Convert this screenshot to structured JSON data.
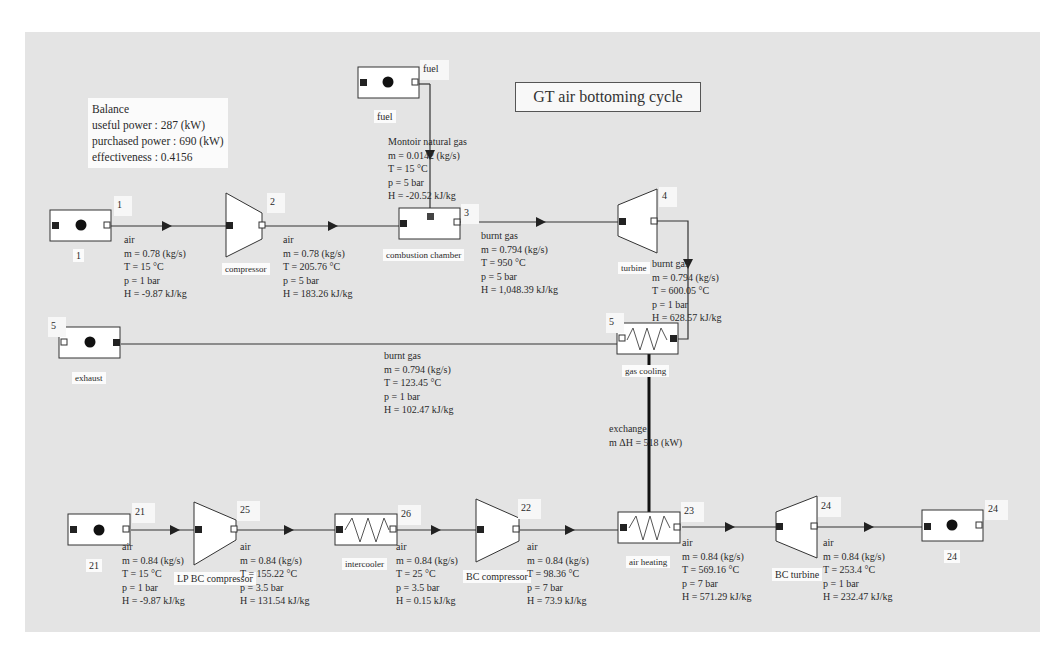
{
  "title": "GT air bottoming cycle",
  "balance": {
    "heading": "Balance",
    "useful_power": "useful power : 287 (kW)",
    "purchased_power": "purchased power : 690 (kW)",
    "effectiveness": "effectiveness : 0.4156"
  },
  "components": {
    "source_1": {
      "number": "1",
      "name": "1"
    },
    "fuel": {
      "number": "fuel",
      "name": "fuel"
    },
    "compressor": {
      "number": "2",
      "name": "compressor"
    },
    "combustion_chamber": {
      "number": "3",
      "name": "combustion chamber"
    },
    "turbine": {
      "number": "4",
      "name": "turbine"
    },
    "gas_cooling": {
      "number": "5",
      "name": "gas cooling"
    },
    "exhaust": {
      "number": "5",
      "name": "exhaust"
    },
    "source_21": {
      "number": "21",
      "name": "21"
    },
    "lp_bc_compressor": {
      "number": "25",
      "name": "LP BC compressor"
    },
    "intercooler": {
      "number": "26",
      "name": "intercooler"
    },
    "bc_compressor": {
      "number": "22",
      "name": "BC compressor"
    },
    "air_heating": {
      "number": "23",
      "name": "air heating"
    },
    "bc_turbine": {
      "number": "24",
      "name": "BC turbine"
    },
    "sink_24": {
      "number": "24",
      "name": "24"
    }
  },
  "streams": {
    "s1": {
      "fluid": "air",
      "m": "m = 0.78 (kg/s)",
      "T": "T = 15 °C",
      "p": "p = 1 bar",
      "H": "H = -9.87 kJ/kg"
    },
    "s2": {
      "fluid": "air",
      "m": "m = 0.78 (kg/s)",
      "T": "T = 205.76 °C",
      "p": "p = 5 bar",
      "H": "H = 183.26 kJ/kg"
    },
    "fuel": {
      "fluid": "Montoir natural gas",
      "m": "m = 0.0142 (kg/s)",
      "T": "T = 15 °C",
      "p": "p = 5 bar",
      "H": "H = -20.52 kJ/kg"
    },
    "s3": {
      "fluid": "burnt gas",
      "m": "m = 0.794 (kg/s)",
      "T": "T = 950 °C",
      "p": "p = 5 bar",
      "H": "H = 1,048.39 kJ/kg"
    },
    "s4": {
      "fluid": "burnt gas",
      "m": "m = 0.794 (kg/s)",
      "T": "T = 600.05 °C",
      "p": "p = 1 bar",
      "H": "H = 628.57 kJ/kg"
    },
    "s5": {
      "fluid": "burnt gas",
      "m": "m = 0.794 (kg/s)",
      "T": "T = 123.45 °C",
      "p": "p = 1 bar",
      "H": "H = 102.47 kJ/kg"
    },
    "s21": {
      "fluid": "air",
      "m": "m = 0.84 (kg/s)",
      "T": "T = 15 °C",
      "p": "p = 1 bar",
      "H": "H = -9.87 kJ/kg"
    },
    "s25": {
      "fluid": "air",
      "m": "m = 0.84 (kg/s)",
      "T": "T = 155.22 °C",
      "p": "p = 3.5 bar",
      "H": "H = 131.54 kJ/kg"
    },
    "s26": {
      "fluid": "air",
      "m": "m = 0.84 (kg/s)",
      "T": "T = 25 °C",
      "p": "p = 3.5 bar",
      "H": "H = 0.15 kJ/kg"
    },
    "s22": {
      "fluid": "air",
      "m": "m = 0.84 (kg/s)",
      "T": "T = 98.36 °C",
      "p": "p = 7 bar",
      "H": "H = 73.9 kJ/kg"
    },
    "s23": {
      "fluid": "air",
      "m": "m = 0.84 (kg/s)",
      "T": "T = 569.16 °C",
      "p": "p = 7 bar",
      "H": "H = 571.29 kJ/kg"
    },
    "s24": {
      "fluid": "air",
      "m": "m = 0.84 (kg/s)",
      "T": "T = 253.4 °C",
      "p": "p = 1 bar",
      "H": "H = 232.47 kJ/kg"
    }
  },
  "exchange": {
    "label": "exchange",
    "value": "m ΔH = 518 (kW)"
  },
  "colors": {
    "canvas": "#e4e4e4",
    "line": "#333333",
    "box_fill": "#ffffff",
    "port_in": "#222222"
  }
}
